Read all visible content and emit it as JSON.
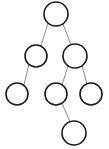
{
  "figure": {
    "canvas": {
      "width": 109,
      "height": 149
    },
    "style": {
      "background_color": "#ffffff",
      "node_fill": "#ffffff",
      "node_stroke": "#1a1a1a",
      "node_stroke_width": 1.6,
      "edge_stroke": "#8a8a8a",
      "edge_stroke_width": 1
    }
  },
  "chart_data": {
    "type": "diagram",
    "diagram_kind": "binary-tree",
    "title": "",
    "xlabel": "",
    "ylabel": "",
    "node_count": 7,
    "edge_count": 6,
    "depth": 4,
    "nodes": [
      {
        "id": "n1",
        "label": "",
        "cx": 56,
        "cy": 14,
        "r": 12,
        "level": 0,
        "role": "root"
      },
      {
        "id": "n2",
        "label": "",
        "cx": 36,
        "cy": 56,
        "r": 11,
        "level": 1,
        "role": "internal"
      },
      {
        "id": "n3",
        "label": "",
        "cx": 75,
        "cy": 56,
        "r": 12,
        "level": 1,
        "role": "internal"
      },
      {
        "id": "n4",
        "label": "",
        "cx": 17,
        "cy": 94,
        "r": 11,
        "level": 2,
        "role": "leaf"
      },
      {
        "id": "n5",
        "label": "",
        "cx": 56,
        "cy": 94,
        "r": 11,
        "level": 2,
        "role": "internal"
      },
      {
        "id": "n6",
        "label": "",
        "cx": 91,
        "cy": 94,
        "r": 11,
        "level": 2,
        "role": "leaf"
      },
      {
        "id": "n7",
        "label": "",
        "cx": 74,
        "cy": 133,
        "r": 12,
        "level": 3,
        "role": "leaf"
      }
    ],
    "edges": [
      {
        "id": "e1",
        "from": "n1",
        "to": "n2",
        "x1": 48,
        "y1": 23,
        "x2": 41,
        "y2": 46
      },
      {
        "id": "e2",
        "from": "n1",
        "to": "n3",
        "x1": 63,
        "y1": 24,
        "x2": 71,
        "y2": 45
      },
      {
        "id": "e3",
        "from": "n2",
        "to": "n4",
        "x1": 29,
        "y1": 64,
        "x2": 24,
        "y2": 85
      },
      {
        "id": "e4",
        "from": "n3",
        "to": "n5",
        "x1": 68,
        "y1": 66,
        "x2": 62,
        "y2": 85
      },
      {
        "id": "e5",
        "from": "n3",
        "to": "n6",
        "x1": 82,
        "y1": 66,
        "x2": 87,
        "y2": 84
      },
      {
        "id": "e6",
        "from": "n5",
        "to": "n7",
        "x1": 62,
        "y1": 103,
        "x2": 70,
        "y2": 122
      }
    ]
  }
}
